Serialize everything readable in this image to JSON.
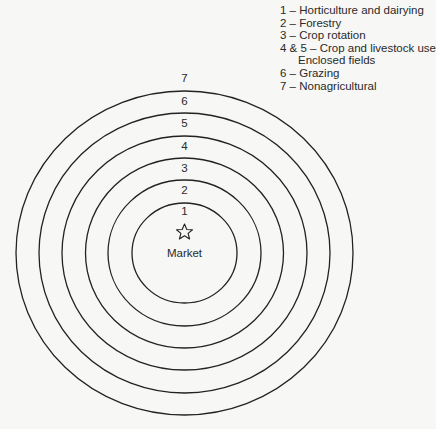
{
  "legend": {
    "items": [
      "1 – Horticulture and dairying",
      "2 – Forestry",
      "3 – Crop rotation",
      "4 & 5 – Crop and livestock use",
      "Enclosed fields",
      "6 – Grazing",
      "7 – Nonagricultural"
    ]
  },
  "rings": {
    "labels": [
      "1",
      "2",
      "3",
      "4",
      "5",
      "6",
      "7"
    ]
  },
  "center": {
    "label": "Market",
    "icon": "star-icon"
  },
  "colors": {
    "stroke": "#222222",
    "background": "#f7f7f5"
  }
}
